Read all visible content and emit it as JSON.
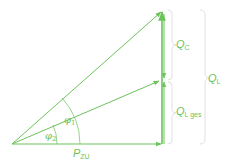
{
  "diagram": {
    "type": "power-triangle-compensation",
    "color": "#6cc35a",
    "labels": {
      "qc": {
        "main": "Q",
        "sub": "C"
      },
      "ql_ges": {
        "main": "Q",
        "sub": "L ges"
      },
      "ql": {
        "main": "Q",
        "sub": "L"
      },
      "pzu": {
        "main": "P",
        "sub": "ZU"
      },
      "phi1": {
        "main": "φ",
        "sub": "1"
      },
      "phi2": {
        "main": "φ",
        "sub": "2"
      }
    }
  }
}
